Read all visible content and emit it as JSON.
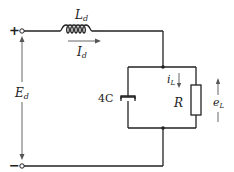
{
  "diagram": {
    "type": "circuit",
    "terminals": {
      "positive": {
        "symbol": "+"
      },
      "negative": {
        "symbol": "−"
      }
    },
    "source_voltage": {
      "label": "E",
      "subscript": "d"
    },
    "inductor": {
      "label": "L",
      "subscript": "d"
    },
    "inductor_current": {
      "label": "I",
      "subscript": "d"
    },
    "capacitor": {
      "label": "4C"
    },
    "resistor": {
      "label": "R"
    },
    "load_current": {
      "label": "i",
      "subscript": "L"
    },
    "load_voltage": {
      "label": "e",
      "subscript": "L"
    },
    "colors": {
      "wire": "#222222",
      "background": "#ffffff",
      "arrow": "#555555"
    }
  }
}
